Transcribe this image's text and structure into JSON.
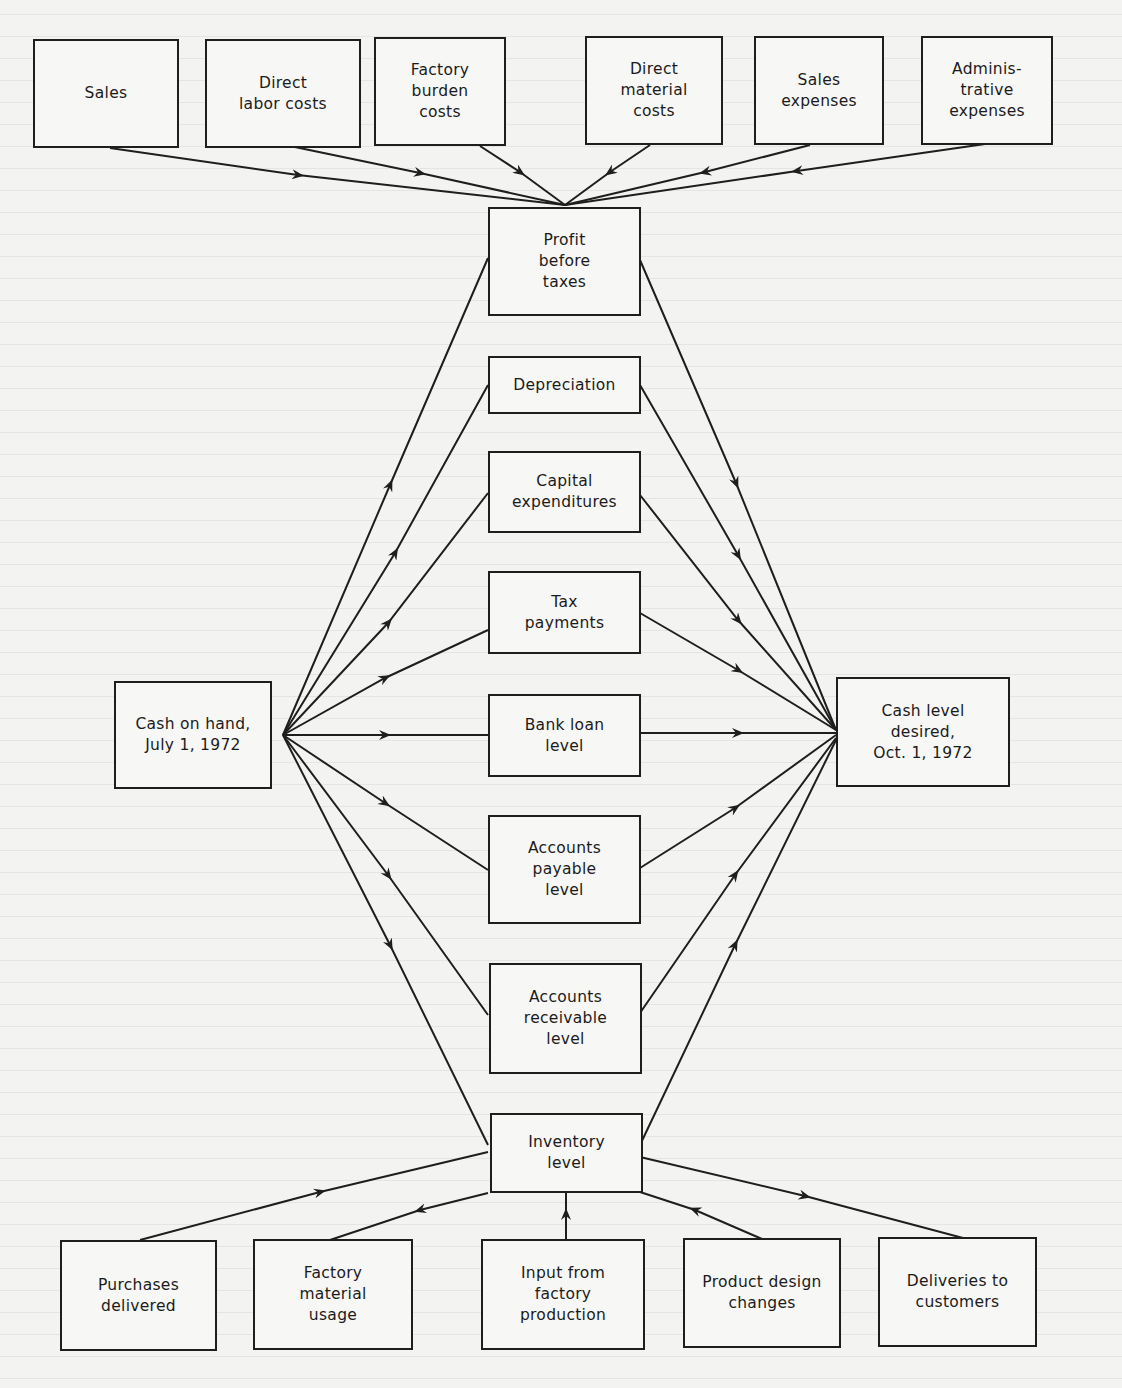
{
  "diagram": {
    "title": "",
    "nodes": {
      "sales": {
        "label": "Sales"
      },
      "direct_labor": {
        "label": "Direct\nlabor costs"
      },
      "factory_burden": {
        "label": "Factory\nburden\ncosts"
      },
      "direct_material": {
        "label": "Direct\nmaterial\ncosts"
      },
      "sales_expenses": {
        "label": "Sales\nexpenses"
      },
      "admin_expenses": {
        "label": "Adminis-\ntrative\nexpenses"
      },
      "profit_before_taxes": {
        "label": "Profit\nbefore\ntaxes"
      },
      "depreciation": {
        "label": "Depreciation"
      },
      "capital_expenditures": {
        "label": "Capital\nexpenditures"
      },
      "tax_payments": {
        "label": "Tax\npayments"
      },
      "bank_loan": {
        "label": "Bank loan\nlevel"
      },
      "accounts_payable": {
        "label": "Accounts\npayable\nlevel"
      },
      "accounts_receivable": {
        "label": "Accounts\nreceivable\nlevel"
      },
      "inventory": {
        "label": "Inventory\nlevel"
      },
      "cash_on_hand": {
        "label": "Cash on hand,\nJuly 1, 1972"
      },
      "cash_desired": {
        "label": "Cash level\ndesired,\nOct. 1, 1972"
      },
      "purchases_delivered": {
        "label": "Purchases\ndelivered"
      },
      "factory_material_usage": {
        "label": "Factory\nmaterial\nusage"
      },
      "input_factory_production": {
        "label": "Input from\nfactory\nproduction"
      },
      "product_design_changes": {
        "label": "Product design\nchanges"
      },
      "deliveries_to_customers": {
        "label": "Deliveries to\ncustomers"
      }
    },
    "edges": [
      {
        "from": "Sales",
        "to": "Profit before taxes"
      },
      {
        "from": "Direct labor costs",
        "to": "Profit before taxes"
      },
      {
        "from": "Factory burden costs",
        "to": "Profit before taxes"
      },
      {
        "from": "Direct material costs",
        "to": "Profit before taxes"
      },
      {
        "from": "Sales expenses",
        "to": "Profit before taxes"
      },
      {
        "from": "Administrative expenses",
        "to": "Profit before taxes"
      },
      {
        "from": "Cash on hand, July 1, 1972",
        "to": "Profit before taxes"
      },
      {
        "from": "Cash on hand, July 1, 1972",
        "to": "Depreciation"
      },
      {
        "from": "Cash on hand, July 1, 1972",
        "to": "Capital expenditures"
      },
      {
        "from": "Cash on hand, July 1, 1972",
        "to": "Tax payments"
      },
      {
        "from": "Cash on hand, July 1, 1972",
        "to": "Bank loan level"
      },
      {
        "from": "Cash on hand, July 1, 1972",
        "to": "Accounts payable level"
      },
      {
        "from": "Cash on hand, July 1, 1972",
        "to": "Accounts receivable level"
      },
      {
        "from": "Cash on hand, July 1, 1972",
        "to": "Inventory level"
      },
      {
        "from": "Profit before taxes",
        "to": "Cash level desired, Oct. 1, 1972"
      },
      {
        "from": "Depreciation",
        "to": "Cash level desired, Oct. 1, 1972"
      },
      {
        "from": "Capital expenditures",
        "to": "Cash level desired, Oct. 1, 1972"
      },
      {
        "from": "Tax payments",
        "to": "Cash level desired, Oct. 1, 1972"
      },
      {
        "from": "Bank loan level",
        "to": "Cash level desired, Oct. 1, 1972"
      },
      {
        "from": "Accounts payable level",
        "to": "Cash level desired, Oct. 1, 1972"
      },
      {
        "from": "Accounts receivable level",
        "to": "Cash level desired, Oct. 1, 1972"
      },
      {
        "from": "Inventory level",
        "to": "Cash level desired, Oct. 1, 1972"
      },
      {
        "from": "Purchases delivered",
        "to": "Inventory level"
      },
      {
        "from": "Inventory level",
        "to": "Factory material usage"
      },
      {
        "from": "Input from factory production",
        "to": "Inventory level"
      },
      {
        "from": "Product design changes",
        "to": "Inventory level"
      },
      {
        "from": "Inventory level",
        "to": "Deliveries to customers"
      }
    ],
    "colors": {
      "line": "#1e1e1e",
      "background": "#f3f3f1"
    }
  }
}
